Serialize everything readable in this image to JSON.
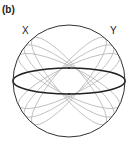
{
  "figure": {
    "panel_label": "(b)",
    "axis_labels": {
      "x": "X",
      "y": "Y"
    },
    "sphere": {
      "cx": 69,
      "cy": 81,
      "r": 56,
      "stroke": "#333333"
    },
    "equator": {
      "cx": 69,
      "cy": 81,
      "rx": 56,
      "ry": 13,
      "stroke": "#222222"
    },
    "great_circles_color": "#b8b8b8",
    "great_circles_angles_deg": [
      -50,
      -38,
      -26,
      26,
      38,
      50
    ]
  }
}
